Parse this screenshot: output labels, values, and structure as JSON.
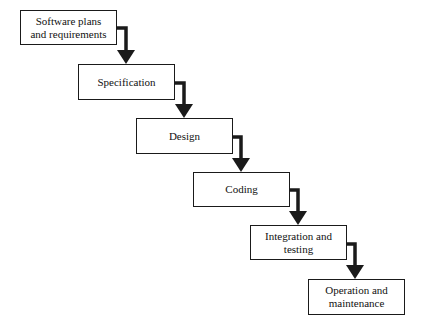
{
  "diagram": {
    "type": "waterfall-model",
    "stages": [
      {
        "id": "plans",
        "label": "Software plans\nand requirements",
        "x": 20,
        "y": 10,
        "w": 97,
        "h": 35
      },
      {
        "id": "spec",
        "label": "Specification",
        "x": 78,
        "y": 64,
        "w": 97,
        "h": 36
      },
      {
        "id": "design",
        "label": "Design",
        "x": 136,
        "y": 118,
        "w": 97,
        "h": 36
      },
      {
        "id": "coding",
        "label": "Coding",
        "x": 193,
        "y": 172,
        "w": 97,
        "h": 35
      },
      {
        "id": "integration",
        "label": "Integration and\ntesting",
        "x": 250,
        "y": 225,
        "w": 97,
        "h": 35
      },
      {
        "id": "operation",
        "label": "Operation and\nmaintenance",
        "x": 308,
        "y": 279,
        "w": 97,
        "h": 36
      }
    ],
    "connectors": [
      {
        "from": "plans",
        "to": "spec"
      },
      {
        "from": "spec",
        "to": "design"
      },
      {
        "from": "design",
        "to": "coding"
      },
      {
        "from": "coding",
        "to": "integration"
      },
      {
        "from": "integration",
        "to": "operation"
      }
    ],
    "colors": {
      "stroke": "#1a1a1a",
      "background": "#ffffff"
    }
  }
}
